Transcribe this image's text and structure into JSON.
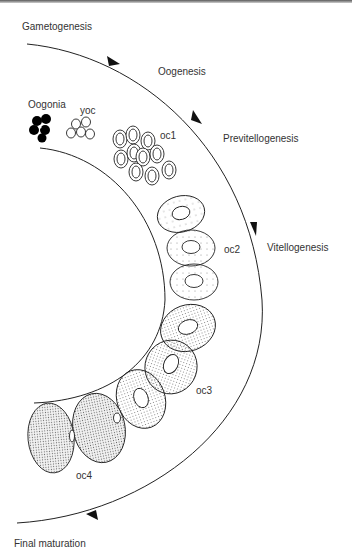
{
  "diagram": {
    "stages": [
      {
        "id": "gametogenesis",
        "label": "Gametogenesis"
      },
      {
        "id": "oogenesis",
        "label": "Oogenesis"
      },
      {
        "id": "previtellogenesis",
        "label": "Previtellogenesis"
      },
      {
        "id": "vitellogenesis",
        "label": "Vitellogenesis"
      },
      {
        "id": "final_maturation",
        "label": "Final maturation"
      }
    ],
    "cells": [
      {
        "id": "oogonia",
        "label": "Oogonia"
      },
      {
        "id": "yoc",
        "label": "yoc"
      },
      {
        "id": "oc1",
        "label": "oc1"
      },
      {
        "id": "oc2",
        "label": "oc2"
      },
      {
        "id": "oc3",
        "label": "oc3"
      },
      {
        "id": "oc4",
        "label": "oc4"
      }
    ],
    "colors": {
      "line": "#222222",
      "text": "#333333",
      "oogonia_fill": "#000000",
      "stipple_light": "#888888",
      "stipple_dense": "#666666"
    }
  }
}
